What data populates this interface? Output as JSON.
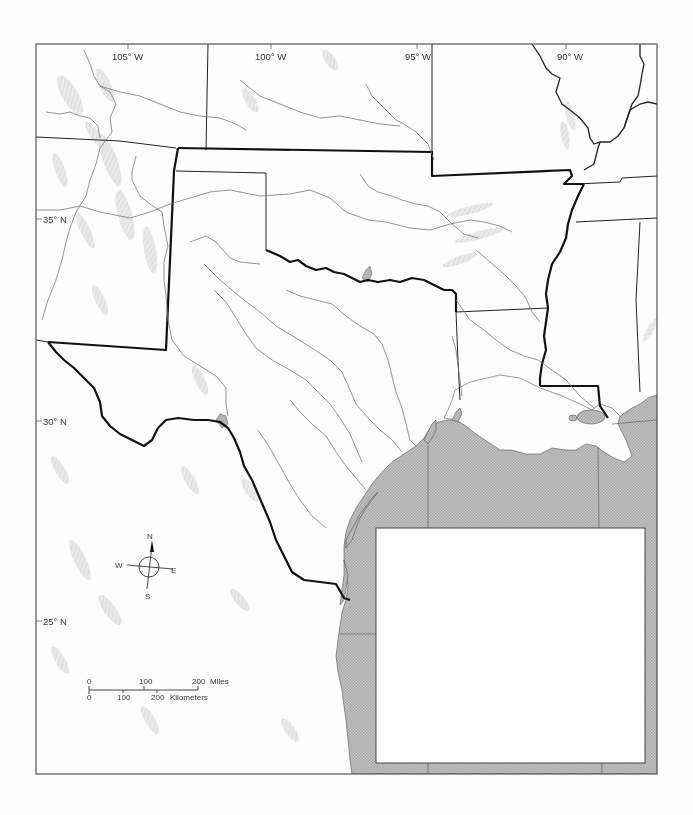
{
  "map": {
    "type": "outline base map",
    "region": "Texas and surrounding south-central United States with Gulf of Mexico",
    "colors": {
      "background": "#fdfdfd",
      "frame": "#555555",
      "water": "#b4b4b4",
      "state_border": "#111111",
      "river": "#777777",
      "relief_shade": "#d8d8d8",
      "inset_box": "#ffffff"
    },
    "longitude_labels": [
      {
        "label": "105° W"
      },
      {
        "label": "100° W"
      },
      {
        "label": "95° W"
      },
      {
        "label": "90° W"
      }
    ],
    "latitude_labels": [
      {
        "label": "35° N"
      },
      {
        "label": "30° N"
      },
      {
        "label": "25° N"
      }
    ],
    "compass": {
      "north": "N",
      "south": "S",
      "east": "E",
      "west": "W"
    },
    "scale_bar": {
      "miles": {
        "ticks": [
          "0",
          "100",
          "200"
        ],
        "unit": "Miles"
      },
      "kilometers": {
        "ticks": [
          "0",
          "100",
          "200"
        ],
        "unit": "Kilometers"
      }
    },
    "inset_box": {
      "content": ""
    }
  }
}
